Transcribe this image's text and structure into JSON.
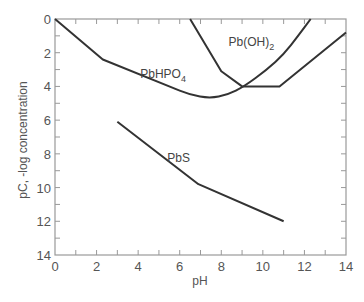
{
  "chart_data": {
    "type": "line",
    "title": "",
    "xlabel": "pH",
    "ylabel": "pC, -log concentration",
    "xlim": [
      0,
      14
    ],
    "ylim": [
      0,
      14
    ],
    "y_inverted": true,
    "grid": false,
    "xticks": [
      0,
      2,
      4,
      6,
      8,
      10,
      12,
      14
    ],
    "yticks": [
      0,
      2,
      4,
      6,
      8,
      10,
      12,
      14
    ],
    "minor_tick_step": 1,
    "legend": "inline labels",
    "series": [
      {
        "name": "PbHPO4",
        "label_main": "PbHPO",
        "label_sub": "4",
        "label_pos": [
          4.1,
          3.5
        ],
        "points": [
          [
            0,
            0
          ],
          [
            2.3,
            2.4
          ],
          [
            5.5,
            4.0
          ],
          [
            6.5,
            4.5
          ],
          [
            7.45,
            4.7
          ],
          [
            8.3,
            4.5
          ],
          [
            9.1,
            4.0
          ],
          [
            10.2,
            3.0
          ],
          [
            11.0,
            2.1
          ],
          [
            11.7,
            1.0
          ],
          [
            12.3,
            0
          ]
        ]
      },
      {
        "name": "Pb(OH)2",
        "label_main": "Pb(OH)",
        "label_sub": "2",
        "label_pos": [
          8.35,
          1.6
        ],
        "points": [
          [
            6.5,
            0
          ],
          [
            8.0,
            3.1
          ],
          [
            9.0,
            4.0
          ],
          [
            10.8,
            4.0
          ],
          [
            14.0,
            0.8
          ]
        ]
      },
      {
        "name": "PbS",
        "label_main": "PbS",
        "label_sub": "",
        "label_pos": [
          5.4,
          8.5
        ],
        "points": [
          [
            3.0,
            6.1
          ],
          [
            6.9,
            9.8
          ],
          [
            11.0,
            12.0
          ]
        ]
      }
    ],
    "colors": {
      "curve": "#333333",
      "axis": "#999999",
      "tick_label": "#555555"
    }
  }
}
